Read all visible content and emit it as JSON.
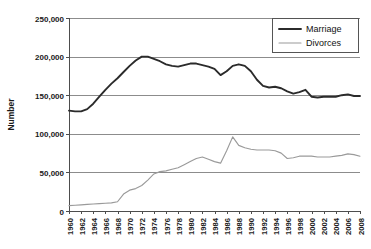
{
  "chart_data": {
    "type": "line",
    "title": "",
    "xlabel": "",
    "ylabel": "Number",
    "ylim": [
      0,
      250000
    ],
    "xlim": [
      1960,
      2008
    ],
    "grid": true,
    "legend_position": "top-right",
    "ytick_labels": [
      "0",
      "50,000",
      "100,000",
      "150,000",
      "200,000",
      "250,000"
    ],
    "ytick_values": [
      0,
      50000,
      100000,
      150000,
      200000,
      250000
    ],
    "xtick_labels": [
      "1960",
      "1962",
      "1964",
      "1966",
      "1968",
      "1970",
      "1972",
      "1974",
      "1976",
      "1978",
      "1980",
      "1982",
      "1984",
      "1986",
      "1988",
      "1990",
      "1992",
      "1994",
      "1996",
      "1998",
      "2000",
      "2002",
      "2004",
      "2006",
      "2008"
    ],
    "x": [
      1960,
      1961,
      1962,
      1963,
      1964,
      1965,
      1966,
      1967,
      1968,
      1969,
      1970,
      1971,
      1972,
      1973,
      1974,
      1975,
      1976,
      1977,
      1978,
      1979,
      1980,
      1981,
      1982,
      1983,
      1984,
      1985,
      1986,
      1987,
      1988,
      1989,
      1990,
      1991,
      1992,
      1993,
      1994,
      1995,
      1996,
      1997,
      1998,
      1999,
      2000,
      2001,
      2002,
      2003,
      2004,
      2005,
      2006,
      2007,
      2008
    ],
    "series": [
      {
        "name": "Marriage",
        "color": "#2b2b2b",
        "line_width": "thick",
        "values": [
          130000,
          129000,
          129000,
          132000,
          139000,
          148000,
          157000,
          165000,
          172000,
          180000,
          188000,
          195000,
          200000,
          200000,
          197000,
          194000,
          190000,
          188000,
          187000,
          189000,
          191000,
          191000,
          189000,
          187000,
          184000,
          176000,
          181000,
          188000,
          190000,
          188000,
          181000,
          170000,
          162000,
          160000,
          161000,
          159000,
          155000,
          152000,
          154000,
          157000,
          148000,
          147000,
          148000,
          148000,
          148000,
          150000,
          151000,
          149000,
          149000
        ]
      },
      {
        "name": "Divorces",
        "color": "#9a9a9a",
        "line_width": "thin",
        "values": [
          7000,
          7500,
          8000,
          8500,
          9000,
          9500,
          10000,
          10500,
          12000,
          22000,
          27000,
          29000,
          33000,
          40000,
          48000,
          51000,
          52000,
          54000,
          56000,
          60000,
          64000,
          68000,
          70000,
          67000,
          64000,
          62000,
          78000,
          96000,
          85000,
          82000,
          80000,
          79000,
          79000,
          79000,
          78000,
          75000,
          68000,
          69000,
          71000,
          71000,
          71000,
          70000,
          70000,
          70000,
          71000,
          72000,
          74000,
          73000,
          71000
        ]
      }
    ]
  },
  "legend": {
    "items": [
      {
        "label": "Marriage"
      },
      {
        "label": "Divorces"
      }
    ]
  }
}
